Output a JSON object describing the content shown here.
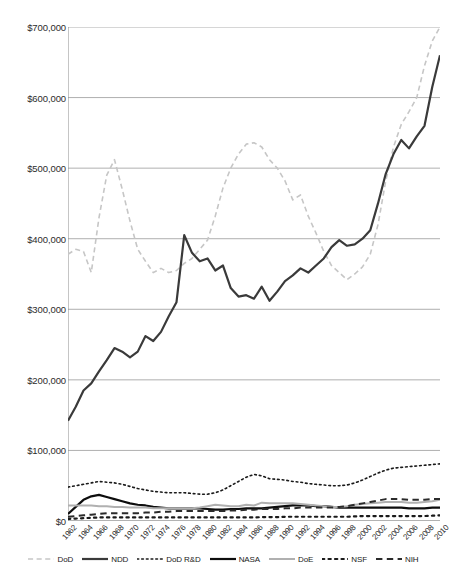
{
  "chart_data": {
    "type": "line",
    "title": "",
    "subtitle": "",
    "xlabel": "",
    "ylabel": "",
    "xlim": [
      1962,
      2010
    ],
    "ylim": [
      0,
      700000
    ],
    "ytick_labels": [
      "$0",
      "$100,000",
      "$200,000",
      "$300,000",
      "$400,000",
      "$500,000",
      "$600,000",
      "$700,000"
    ],
    "ytick_values": [
      0,
      100000,
      200000,
      300000,
      400000,
      500000,
      600000,
      700000
    ],
    "grid": "horizontal",
    "legend_position": "bottom",
    "x": [
      1962,
      1963,
      1964,
      1965,
      1966,
      1967,
      1968,
      1969,
      1970,
      1971,
      1972,
      1973,
      1974,
      1975,
      1976,
      1977,
      1978,
      1979,
      1980,
      1981,
      1982,
      1983,
      1984,
      1985,
      1986,
      1987,
      1988,
      1989,
      1990,
      1991,
      1992,
      1993,
      1994,
      1995,
      1996,
      1997,
      1998,
      1999,
      2000,
      2001,
      2002,
      2003,
      2004,
      2005,
      2006,
      2007,
      2008,
      2009,
      2010
    ],
    "xtick_labels": [
      "1962",
      "1964",
      "1966",
      "1968",
      "1970",
      "1972",
      "1974",
      "1976",
      "1978",
      "1980",
      "1982",
      "1984",
      "1986",
      "1988",
      "1990",
      "1992",
      "1994",
      "1996",
      "1998",
      "2000",
      "2002",
      "2004",
      "2006",
      "2008",
      "2010"
    ],
    "series": [
      {
        "name": "DoD",
        "style": "dashed",
        "color": "#c6c6c6",
        "width": 1.6,
        "values": [
          378000,
          385000,
          382000,
          352000,
          430000,
          490000,
          512000,
          470000,
          425000,
          385000,
          368000,
          352000,
          358000,
          352000,
          355000,
          365000,
          372000,
          385000,
          398000,
          432000,
          472000,
          500000,
          520000,
          534000,
          536000,
          530000,
          512000,
          500000,
          482000,
          455000,
          462000,
          432000,
          408000,
          382000,
          362000,
          352000,
          342000,
          350000,
          360000,
          378000,
          420000,
          482000,
          530000,
          562000,
          580000,
          600000,
          645000,
          680000,
          700000
        ]
      },
      {
        "name": "NDD",
        "style": "solid",
        "color": "#3a3a3a",
        "width": 2.2,
        "values": [
          142000,
          162000,
          185000,
          195000,
          212000,
          228000,
          245000,
          240000,
          232000,
          240000,
          262000,
          255000,
          268000,
          290000,
          310000,
          405000,
          380000,
          368000,
          372000,
          355000,
          362000,
          330000,
          318000,
          320000,
          315000,
          332000,
          312000,
          325000,
          340000,
          348000,
          358000,
          352000,
          362000,
          372000,
          388000,
          398000,
          390000,
          392000,
          400000,
          412000,
          450000,
          492000,
          520000,
          540000,
          528000,
          545000,
          560000,
          615000,
          660000
        ]
      },
      {
        "name": "DoD R&D",
        "style": "dotted",
        "color": "#1a1a1a",
        "width": 1.6,
        "values": [
          48000,
          50000,
          52000,
          54000,
          56000,
          55000,
          54000,
          52000,
          49000,
          46000,
          44000,
          42000,
          41000,
          40000,
          40000,
          40000,
          39000,
          38000,
          38000,
          40000,
          44000,
          50000,
          56000,
          62000,
          66000,
          64000,
          60000,
          59000,
          58000,
          56000,
          55000,
          53000,
          52000,
          51000,
          50000,
          50000,
          51000,
          54000,
          58000,
          63000,
          68000,
          72000,
          75000,
          76000,
          77000,
          78000,
          79000,
          80000,
          81000
        ]
      },
      {
        "name": "NASA",
        "style": "solid",
        "color": "#0d0d0d",
        "width": 2.2,
        "values": [
          10000,
          20000,
          30000,
          35000,
          37000,
          34000,
          31000,
          28000,
          25000,
          23000,
          22000,
          20000,
          19000,
          18000,
          18000,
          18000,
          18000,
          18000,
          17000,
          16000,
          16000,
          17000,
          17000,
          18000,
          18000,
          18000,
          19000,
          20000,
          21000,
          22000,
          22000,
          22000,
          21000,
          21000,
          20000,
          19000,
          19000,
          19000,
          19000,
          19000,
          19000,
          19000,
          19000,
          19000,
          18000,
          18000,
          18000,
          19000,
          19000
        ]
      },
      {
        "name": "DoE",
        "style": "solid",
        "color": "#b0b0b0",
        "width": 2.0,
        "values": [
          22000,
          22000,
          22000,
          22000,
          21000,
          21000,
          20000,
          20000,
          19000,
          19000,
          19000,
          18000,
          18000,
          18000,
          18000,
          18000,
          18000,
          19000,
          21000,
          23000,
          22000,
          21000,
          21000,
          23000,
          22000,
          26000,
          25000,
          25000,
          25000,
          25000,
          24000,
          23000,
          22000,
          21000,
          20000,
          20000,
          21000,
          23000,
          24000,
          25000,
          26000,
          27000,
          27000,
          27000,
          26000,
          26000,
          27000,
          28000,
          30000
        ]
      },
      {
        "name": "NSF",
        "style": "dotted",
        "color": "#1a1a1a",
        "width": 2.2,
        "values": [
          3000,
          3500,
          4000,
          4500,
          5000,
          5000,
          5000,
          5000,
          5000,
          5000,
          5000,
          5000,
          5000,
          5000,
          5000,
          5000,
          5000,
          5000,
          5000,
          5000,
          5000,
          5000,
          5000,
          5000,
          5000,
          5500,
          5500,
          5500,
          6000,
          6000,
          6000,
          6000,
          6000,
          6000,
          6000,
          6000,
          6000,
          6500,
          7000,
          7000,
          7000,
          7000,
          7000,
          7000,
          7000,
          7000,
          7000,
          7500,
          8000
        ]
      },
      {
        "name": "NIH",
        "style": "dashed",
        "color": "#2b2b2b",
        "width": 2.0,
        "values": [
          6000,
          7000,
          8000,
          9000,
          10000,
          11000,
          11000,
          11000,
          11000,
          11000,
          12000,
          12000,
          13000,
          13000,
          14000,
          14000,
          14000,
          14000,
          14000,
          14000,
          14000,
          15000,
          15000,
          16000,
          16000,
          17000,
          17000,
          17000,
          18000,
          18000,
          19000,
          19000,
          19000,
          19000,
          19000,
          20000,
          21000,
          23000,
          25000,
          27000,
          29000,
          31000,
          31000,
          31000,
          30000,
          30000,
          30000,
          31000,
          31000
        ]
      }
    ]
  },
  "legend": {
    "items": [
      {
        "label": "DoD"
      },
      {
        "label": "NDD"
      },
      {
        "label": "DoD R&D"
      },
      {
        "label": "NASA"
      },
      {
        "label": "DoE"
      },
      {
        "label": "NSF"
      },
      {
        "label": "NIH"
      }
    ]
  }
}
